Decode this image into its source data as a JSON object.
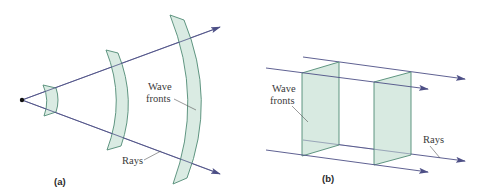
{
  "figure": {
    "colors": {
      "wavefront_fill": "#d4e8de",
      "wavefront_stroke": "#4f8a74",
      "ray": "#4d4f86",
      "text": "#3a3a3a",
      "source": "#111111"
    },
    "panel_a": {
      "label": "(a)",
      "title": "Spherical wave fronts from a point source",
      "wave_fronts_label_line1": "Wave",
      "wave_fronts_label_line2": "fronts",
      "rays_label": "Rays",
      "wavefront_count": 3
    },
    "panel_b": {
      "label": "(b)",
      "title": "Plane wave fronts",
      "wave_fronts_label_line1": "Wave",
      "wave_fronts_label_line2": "fronts",
      "rays_label": "Rays",
      "wavefront_count": 2
    }
  }
}
